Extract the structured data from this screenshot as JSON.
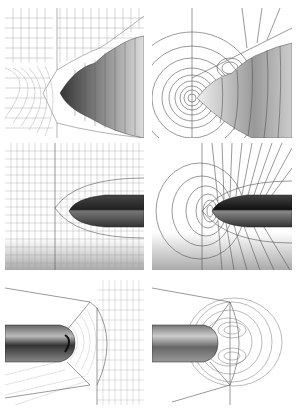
{
  "figure": {
    "layout": "3 rows x 2 columns",
    "panels": [
      {
        "id": "a",
        "row": 1,
        "col": 1,
        "kind": "mesh",
        "description": "computational grid around blunt body, view 1"
      },
      {
        "id": "b",
        "row": 1,
        "col": 2,
        "kind": "contours",
        "description": "contour lines around blunt body, view 1"
      },
      {
        "id": "c",
        "row": 2,
        "col": 1,
        "kind": "mesh",
        "description": "computational grid around slender body, view 2"
      },
      {
        "id": "d",
        "row": 2,
        "col": 2,
        "kind": "contours",
        "description": "contour lines around slender body, view 2"
      },
      {
        "id": "e",
        "row": 3,
        "col": 1,
        "kind": "mesh",
        "description": "computational grid around cylindrical body with rounded nose, view 3"
      },
      {
        "id": "f",
        "row": 3,
        "col": 2,
        "kind": "contours",
        "description": "contour lines near rounded nose, view 3"
      }
    ],
    "colors": {
      "line": "#555555",
      "body_dark": "#222222",
      "body_light": "#bbbbbb",
      "background": "#ffffff"
    }
  }
}
